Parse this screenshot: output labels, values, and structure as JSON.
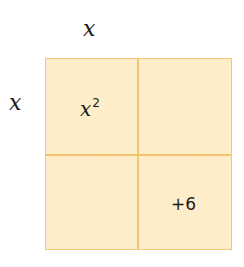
{
  "diagram": {
    "type": "area-model",
    "top_label": "x",
    "side_label": "x",
    "colors": {
      "fill": "#fdecc6",
      "border": "#f2c877"
    },
    "cells": [
      {
        "position": "top-left",
        "base": "x",
        "exponent": "2"
      },
      {
        "position": "top-right",
        "text": ""
      },
      {
        "position": "bottom-left",
        "text": ""
      },
      {
        "position": "bottom-right",
        "text": "+6"
      }
    ]
  }
}
